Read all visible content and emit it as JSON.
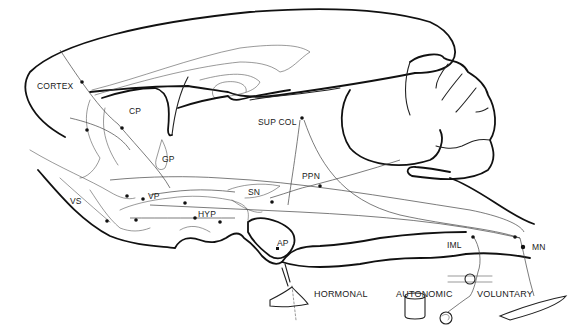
{
  "figure": {
    "line_color": "#111111",
    "background": "#ffffff"
  },
  "labels": {
    "cortex": "CORTEX",
    "cp": "CP",
    "gp": "GP",
    "vs": "VS",
    "vp": "VP",
    "hyp": "HYP",
    "sn": "SN",
    "sup_col": "SUP COL",
    "ppn": "PPN",
    "ap": "AP",
    "iml": "IML",
    "mn": "MN"
  },
  "outputs": {
    "hormonal": "HORMONAL",
    "autonomic": "AUTONOMIC",
    "voluntary": "VOLUNTARY"
  }
}
